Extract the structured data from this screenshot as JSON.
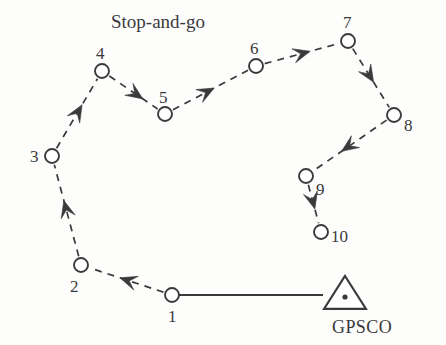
{
  "figure": {
    "title": "Stop-and-go",
    "station_label": "GPSCO",
    "stroke_color": "#3a3a3c",
    "background_color": "#fdfdfc",
    "point_fill": "#ffffff",
    "point_radius": 7,
    "dash_pattern": "7 6",
    "baseline_style": "solid",
    "path_style": "dashed-with-arrowheads"
  },
  "points": [
    {
      "id": "1",
      "label": "1",
      "cx": 172,
      "cy": 295,
      "label_x": 168,
      "label_y": 308
    },
    {
      "id": "2",
      "label": "2",
      "cx": 81,
      "cy": 265,
      "label_x": 70,
      "label_y": 278
    },
    {
      "id": "3",
      "label": "3",
      "cx": 52,
      "cy": 156,
      "label_x": 30,
      "label_y": 148
    },
    {
      "id": "4",
      "label": "4",
      "cx": 102,
      "cy": 71,
      "label_x": 96,
      "label_y": 45
    },
    {
      "id": "5",
      "label": "5",
      "cx": 165,
      "cy": 114,
      "label_x": 159,
      "label_y": 89
    },
    {
      "id": "6",
      "label": "6",
      "cx": 256,
      "cy": 66,
      "label_x": 250,
      "label_y": 40
    },
    {
      "id": "7",
      "label": "7",
      "cx": 348,
      "cy": 41,
      "label_x": 343,
      "label_y": 14
    },
    {
      "id": "8",
      "label": "8",
      "cx": 394,
      "cy": 115,
      "label_x": 404,
      "label_y": 117
    },
    {
      "id": "9",
      "label": "9",
      "cx": 306,
      "cy": 176,
      "label_x": 316,
      "label_y": 181
    },
    {
      "id": "10",
      "label": "10",
      "cx": 321,
      "cy": 232,
      "label_x": 331,
      "label_y": 228
    }
  ],
  "segments": [
    {
      "from": "1",
      "to": "2",
      "arrow_t": 0.48
    },
    {
      "from": "2",
      "to": "3",
      "arrow_t": 0.52
    },
    {
      "from": "3",
      "to": "4",
      "arrow_t": 0.52
    },
    {
      "from": "4",
      "to": "5",
      "arrow_t": 0.55
    },
    {
      "from": "5",
      "to": "6",
      "arrow_t": 0.45
    },
    {
      "from": "6",
      "to": "7",
      "arrow_t": 0.5
    },
    {
      "from": "7",
      "to": "8",
      "arrow_t": 0.45
    },
    {
      "from": "8",
      "to": "9",
      "arrow_t": 0.52
    },
    {
      "from": "9",
      "to": "10",
      "arrow_t": 0.42
    }
  ],
  "base_station": {
    "marker": "triangle-with-center-dot",
    "cx": 345,
    "cy": 295,
    "half_width": 21,
    "height": 33,
    "label": "GPSCO",
    "label_x": 332,
    "label_y": 318
  },
  "baseline": {
    "from_point": "1",
    "to_x": 323,
    "to_y": 295
  },
  "title_position": {
    "x": 111,
    "y": 12
  }
}
